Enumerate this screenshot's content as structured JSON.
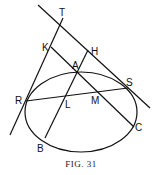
{
  "caption": "FIG. 31",
  "labels": {
    "T": "T",
    "K": "K",
    "H": "H",
    "A": "A",
    "S": "S",
    "R": "R",
    "L": "L",
    "M": "M",
    "C": "C",
    "B": "B"
  },
  "elements": {
    "ellipse": {
      "cx": 81,
      "cy": 112,
      "rx": 56,
      "ry": 40
    },
    "tangent_TS": {
      "from": [
        38,
        5
      ],
      "to": [
        150,
        108
      ]
    },
    "tangent_TR": {
      "from": [
        63,
        18
      ],
      "to": [
        10,
        135
      ]
    },
    "line_KC": {
      "from": [
        51,
        47
      ],
      "to": [
        134,
        127
      ]
    },
    "line_HB": {
      "from": [
        88,
        50
      ],
      "to": [
        45,
        138
      ]
    },
    "chord_RS": {
      "from": [
        26,
        101
      ],
      "to": [
        128,
        88
      ]
    }
  }
}
